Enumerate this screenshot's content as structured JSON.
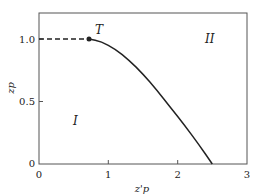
{
  "chart_data": {
    "type": "line",
    "title": "",
    "xlabel": "z'p",
    "ylabel": "zp",
    "xlim": [
      0,
      3
    ],
    "ylim": [
      0,
      1.15
    ],
    "xticks": [
      0,
      1,
      2,
      3
    ],
    "xtick_labels": [
      "0",
      "1",
      "2",
      "3"
    ],
    "yticks": [
      0,
      0.5,
      1.0
    ],
    "ytick_labels": [
      "0",
      "0.5",
      "1.0"
    ],
    "grid": false,
    "legend": null,
    "series": [
      {
        "name": "dashed segment",
        "style": "dashed",
        "x": [
          0,
          0.72
        ],
        "y": [
          1.0,
          1.0
        ]
      },
      {
        "name": "boundary curve",
        "style": "solid",
        "x": [
          0.72,
          0.9,
          1.1,
          1.3,
          1.5,
          1.7,
          1.9,
          2.1,
          2.3,
          2.5
        ],
        "y": [
          1.0,
          0.98,
          0.92,
          0.83,
          0.72,
          0.59,
          0.45,
          0.31,
          0.16,
          0.0
        ]
      }
    ],
    "annotations": [
      {
        "text": "T",
        "x": 0.72,
        "y": 1.0,
        "marker": "dot"
      },
      {
        "text": "I",
        "x": 0.5,
        "y": 0.35
      },
      {
        "text": "II",
        "x": 2.4,
        "y": 1.0
      }
    ]
  }
}
